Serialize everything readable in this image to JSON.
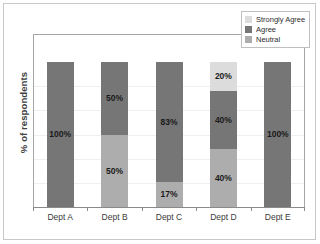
{
  "chart_data": {
    "type": "bar",
    "subtype": "100% stacked bar",
    "title": "",
    "subtitle": "",
    "xlabel": "",
    "ylabel": "% of respondents",
    "ylim": [
      0,
      100
    ],
    "grid": true,
    "legend_position": "top-right",
    "categories": [
      "Dept A",
      "Dept B",
      "Dept C",
      "Dept D",
      "Dept E"
    ],
    "series": [
      {
        "name": "Strongly Agree",
        "color": "#dcdcdc",
        "values": [
          0,
          0,
          0,
          20,
          0
        ],
        "labels": [
          "",
          "",
          "",
          "20%",
          ""
        ]
      },
      {
        "name": "Agree",
        "color": "#767676",
        "values": [
          100,
          50,
          83,
          40,
          100
        ],
        "labels": [
          "100%",
          "50%",
          "83%",
          "40%",
          "100%"
        ]
      },
      {
        "name": "Neutral",
        "color": "#adadad",
        "values": [
          0,
          50,
          17,
          40,
          0
        ],
        "labels": [
          "",
          "50%",
          "17%",
          "40%",
          ""
        ]
      }
    ],
    "stacks": [
      {
        "category": "Dept A",
        "segments": [
          {
            "series": "Agree",
            "value": 100,
            "label": "100%",
            "color": "#767676"
          }
        ]
      },
      {
        "category": "Dept B",
        "segments": [
          {
            "series": "Agree",
            "value": 50,
            "label": "50%",
            "color": "#767676"
          },
          {
            "series": "Neutral",
            "value": 50,
            "label": "50%",
            "color": "#adadad"
          }
        ]
      },
      {
        "category": "Dept C",
        "segments": [
          {
            "series": "Agree",
            "value": 83,
            "label": "83%",
            "color": "#767676"
          },
          {
            "series": "Neutral",
            "value": 17,
            "label": "17%",
            "color": "#adadad"
          }
        ]
      },
      {
        "category": "Dept D",
        "segments": [
          {
            "series": "Strongly Agree",
            "value": 20,
            "label": "20%",
            "color": "#dcdcdc"
          },
          {
            "series": "Agree",
            "value": 40,
            "label": "40%",
            "color": "#767676"
          },
          {
            "series": "Neutral",
            "value": 40,
            "label": "40%",
            "color": "#adadad"
          }
        ]
      },
      {
        "category": "Dept E",
        "segments": [
          {
            "series": "Agree",
            "value": 100,
            "label": "100%",
            "color": "#767676"
          }
        ]
      }
    ]
  },
  "legend": {
    "entries": [
      {
        "label": "Strongly Agree",
        "color": "#dcdcdc"
      },
      {
        "label": "Agree",
        "color": "#767676"
      },
      {
        "label": "Neutral",
        "color": "#adadad"
      }
    ]
  },
  "axes": {
    "y_title": "% of respondents",
    "x_tick_labels": [
      "Dept A",
      "Dept B",
      "Dept C",
      "Dept D",
      "Dept E"
    ]
  },
  "colors": {
    "strongly_agree": "#dcdcdc",
    "agree": "#767676",
    "neutral": "#adadad",
    "axis_line": "#a6a6a6",
    "gridline": "#f0eeee",
    "outer_border": "#c8c8c8",
    "plot_background": "#ffffff"
  }
}
